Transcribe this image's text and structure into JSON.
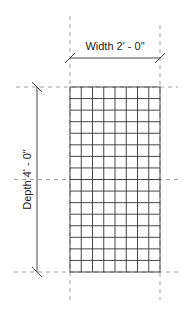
{
  "diagram": {
    "type": "dimensioned-grid-panel",
    "width_label": "Width 2' - 0\"",
    "depth_label": "Depth 4' - 0\"",
    "grid": {
      "columns": 8,
      "rows": 16
    },
    "colors": {
      "line": "#333333",
      "dash": "#888888",
      "text": "#222222",
      "background": "#ffffff"
    }
  }
}
